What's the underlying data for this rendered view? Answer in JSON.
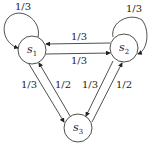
{
  "diagram": {
    "type": "markov-chain",
    "nodes": [
      {
        "id": "s1",
        "label": "s",
        "sub": "1"
      },
      {
        "id": "s2",
        "label": "s",
        "sub": "2"
      },
      {
        "id": "s3",
        "label": "s",
        "sub": "3"
      }
    ],
    "edges": [
      {
        "from": "s1",
        "to": "s1",
        "label": "1/3"
      },
      {
        "from": "s2",
        "to": "s2",
        "label": "1/3"
      },
      {
        "from": "s2",
        "to": "s1",
        "label": "1/3"
      },
      {
        "from": "s1",
        "to": "s2",
        "label": "1/3"
      },
      {
        "from": "s1",
        "to": "s3",
        "label": "1/3"
      },
      {
        "from": "s3",
        "to": "s1",
        "label": "1/2"
      },
      {
        "from": "s2",
        "to": "s3",
        "label": "1/3"
      },
      {
        "from": "s3",
        "to": "s2",
        "label": "1/2"
      }
    ]
  }
}
